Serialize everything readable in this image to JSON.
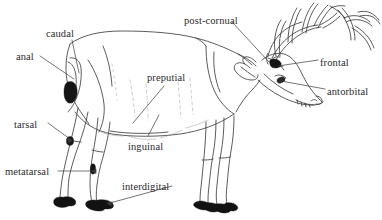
{
  "figure": {
    "background_color": "#ffffff",
    "ink_color": "#3a3a3a",
    "gland_fill_color": "#1a1a1a",
    "label_color": "#2b2b2b"
  },
  "labels": [
    {
      "id": "caudal",
      "text": "caudal",
      "x": 46,
      "y": 29,
      "align": "left"
    },
    {
      "id": "anal",
      "text": "anal",
      "x": 16,
      "y": 52,
      "align": "left"
    },
    {
      "id": "post-cornual",
      "text": "post-cornual",
      "x": 184,
      "y": 16,
      "align": "left"
    },
    {
      "id": "frontal",
      "text": "frontal",
      "x": 320,
      "y": 58,
      "align": "left"
    },
    {
      "id": "antorbital",
      "text": "antorbital",
      "x": 327,
      "y": 87,
      "align": "left"
    },
    {
      "id": "preputial",
      "text": "preputial",
      "x": 147,
      "y": 73,
      "align": "left"
    },
    {
      "id": "inguinal",
      "text": "inguinal",
      "x": 128,
      "y": 142,
      "align": "left"
    },
    {
      "id": "tarsal",
      "text": "tarsal",
      "x": 14,
      "y": 120,
      "align": "left"
    },
    {
      "id": "metatarsal",
      "text": "metatarsal",
      "x": 5,
      "y": 167,
      "align": "left"
    },
    {
      "id": "interdigital",
      "text": "interdigital",
      "x": 122,
      "y": 182,
      "align": "left"
    }
  ],
  "glands": [
    {
      "id": "caudal-gland",
      "label": "caudal",
      "x": 73,
      "y": 72
    },
    {
      "id": "anal-gland",
      "label": "anal",
      "x": 70,
      "y": 90
    },
    {
      "id": "post-cornual-gland",
      "label": "post-cornual",
      "x": 273,
      "y": 63
    },
    {
      "id": "frontal-gland",
      "label": "frontal",
      "x": 276,
      "y": 62
    },
    {
      "id": "antorbital-gland",
      "label": "antorbital",
      "x": 281,
      "y": 85
    },
    {
      "id": "preputial-gland",
      "label": "preputial",
      "x": 123,
      "y": 118
    },
    {
      "id": "inguinal-gland",
      "label": "inguinal",
      "x": 150,
      "y": 123
    },
    {
      "id": "tarsal-gland",
      "label": "tarsal",
      "x": 69,
      "y": 141
    },
    {
      "id": "metatarsal-gland",
      "label": "metatarsal",
      "x": 92,
      "y": 168
    },
    {
      "id": "interdigital-gland",
      "label": "interdigital",
      "x": 104,
      "y": 201
    }
  ],
  "leader_lines": [
    {
      "id": "caudal-leader",
      "from": [
        72,
        40
      ],
      "to": [
        78,
        72
      ]
    },
    {
      "id": "anal-leader",
      "from": [
        40,
        56
      ],
      "to": [
        74,
        78
      ]
    },
    {
      "id": "post-cornual-leader",
      "from": [
        232,
        22
      ],
      "to": [
        268,
        62
      ]
    },
    {
      "id": "frontal-leader",
      "from": [
        317,
        60
      ],
      "to": [
        277,
        66
      ]
    },
    {
      "id": "antorbital-leader",
      "from": [
        324,
        89
      ],
      "to": [
        280,
        81
      ]
    },
    {
      "id": "preputial-leader",
      "from": [
        163,
        86
      ],
      "to": [
        133,
        122
      ]
    },
    {
      "id": "inguinal-leader",
      "from": [
        148,
        136
      ],
      "to": [
        158,
        116
      ]
    },
    {
      "id": "tarsal-leader",
      "from": [
        48,
        123
      ],
      "to": [
        70,
        138
      ]
    },
    {
      "id": "metatarsal-leader",
      "from": [
        58,
        171
      ],
      "to": [
        95,
        171
      ]
    },
    {
      "id": "interdigital-leader",
      "from": [
        172,
        186
      ],
      "to": [
        110,
        203
      ]
    }
  ]
}
